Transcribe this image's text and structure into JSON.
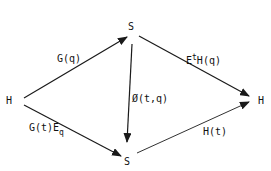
{
  "diagram": {
    "nodes": {
      "h_left": "H",
      "s_top": "S",
      "s_bottom": "S",
      "h_right": "H"
    },
    "edges": {
      "h_to_s_top": "G(q)",
      "h_to_s_bottom_main": "G(t)E",
      "h_to_s_bottom_sub": "q",
      "s_top_to_s_bottom": "Ø(t,q)",
      "s_top_to_h_right_main": "E",
      "s_top_to_h_right_sup": "t",
      "s_top_to_h_right_rest": "H(q)",
      "s_bottom_to_h_right": "H(t)"
    },
    "line_color": "#1a1a1a"
  }
}
